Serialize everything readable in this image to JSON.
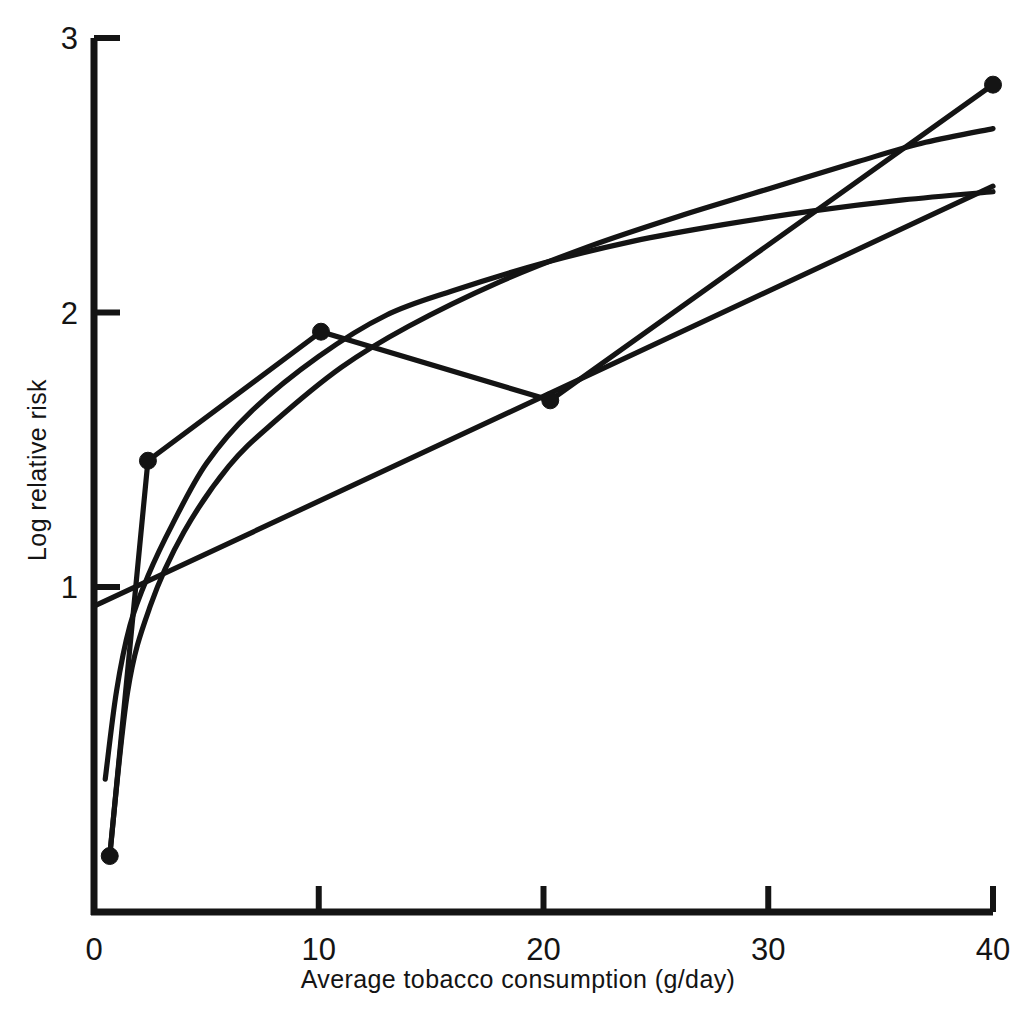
{
  "chart_data": {
    "type": "line",
    "title": "",
    "xlabel": "Average tobacco consumption (g/day)",
    "ylabel": "Log relative risk",
    "xlim": [
      0,
      40
    ],
    "ylim": [
      0,
      3
    ],
    "xticks": [
      0,
      10,
      20,
      30,
      40
    ],
    "xtick_labels": [
      "0",
      "10",
      "20",
      "30",
      "40"
    ],
    "yticks": [
      1,
      2,
      3
    ],
    "ytick_labels": [
      "1",
      "2",
      "3"
    ],
    "grid": false,
    "legend": "none",
    "series": [
      {
        "name": "categorical-estimates",
        "style": "solid-with-markers",
        "markers": true,
        "x": [
          0.7,
          2.4,
          10.1,
          20.3,
          40.0
        ],
        "y": [
          0.02,
          1.46,
          1.93,
          1.68,
          2.83
        ]
      },
      {
        "name": "log-transformed-fit",
        "style": "solid-curve",
        "markers": false,
        "x": [
          0.5,
          1.0,
          1.6,
          2.4,
          3.5,
          5.0,
          7.0,
          10.0,
          13.0,
          16.0,
          20.0,
          24.0,
          28.0,
          32.0,
          36.0,
          40.0
        ],
        "y": [
          0.3,
          0.62,
          0.86,
          1.04,
          1.23,
          1.45,
          1.64,
          1.84,
          1.99,
          2.08,
          2.18,
          2.26,
          2.32,
          2.37,
          2.41,
          2.44
        ]
      },
      {
        "name": "power-transformed-fit",
        "style": "solid-curve",
        "markers": false,
        "x": [
          0.7,
          1.5,
          2.5,
          4.0,
          6.0,
          8.0,
          11.0,
          14.0,
          18.0,
          22.0,
          26.0,
          30.0,
          34.0,
          37.0,
          40.0
        ],
        "y": [
          0.02,
          0.62,
          0.93,
          1.2,
          1.44,
          1.6,
          1.8,
          1.95,
          2.11,
          2.24,
          2.35,
          2.45,
          2.55,
          2.62,
          2.67
        ]
      },
      {
        "name": "linear-fit",
        "style": "solid-straight",
        "markers": false,
        "x": [
          0.0,
          40.0
        ],
        "y": [
          0.93,
          2.46
        ]
      }
    ]
  },
  "axes": {
    "y_axis_name": "y-axis",
    "x_axis_name": "x-axis"
  }
}
